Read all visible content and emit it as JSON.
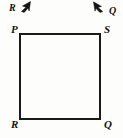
{
  "figure": {
    "name": "square-with-extension-rays",
    "background_color": "#fdfdfb",
    "stroke_color": "#1a1a1a",
    "width": 123,
    "height": 138
  },
  "square": {
    "name": "square-PSQR",
    "left": 20,
    "top": 34,
    "right": 100,
    "bottom": 119,
    "stroke_width": 1.4,
    "fill": "none"
  },
  "vertices": [
    {
      "key": "P",
      "label": "P",
      "position": "top-left",
      "x": 20,
      "y": 34
    },
    {
      "key": "S",
      "label": "S",
      "position": "top-right",
      "x": 100,
      "y": 34
    },
    {
      "key": "R",
      "label": "R",
      "position": "bottom-left",
      "x": 20,
      "y": 119
    },
    {
      "key": "Q",
      "label": "Q",
      "position": "bottom-right",
      "x": 100,
      "y": 119
    }
  ],
  "rays": [
    {
      "key": "ray-R",
      "label": "R",
      "direction": "up-right",
      "arrow_tip_x": 30,
      "arrow_tip_y": 2,
      "arrow_tail_x": 20,
      "arrow_tail_y": 11
    },
    {
      "key": "ray-Q",
      "label": "Q",
      "direction": "up-left",
      "arrow_tip_x": 94,
      "arrow_tip_y": 2,
      "arrow_tail_x": 106,
      "arrow_tail_y": 11
    }
  ]
}
